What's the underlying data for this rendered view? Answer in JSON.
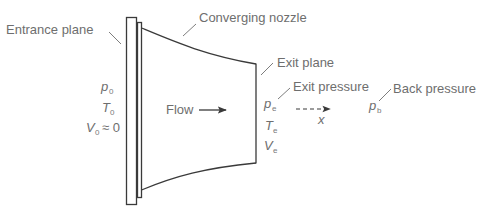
{
  "figure": {
    "labels": {
      "entrance_plane": "Entrance plane",
      "converging_nozzle": "Converging nozzle",
      "exit_plane": "Exit plane",
      "exit_pressure": "Exit pressure",
      "back_pressure": "Back pressure",
      "flow": "Flow",
      "x_axis": "x"
    },
    "inlet_conditions": {
      "pressure": {
        "symbol": "p",
        "subscript": "0"
      },
      "temperature": {
        "symbol": "T",
        "subscript": "0"
      },
      "velocity": {
        "symbol": "V",
        "subscript": "0",
        "relation": "≈ 0"
      }
    },
    "exit_conditions": {
      "pressure": {
        "symbol": "p",
        "subscript": "e"
      },
      "temperature": {
        "symbol": "T",
        "subscript": "e"
      },
      "velocity": {
        "symbol": "V",
        "subscript": "e"
      }
    },
    "back_condition": {
      "pressure": {
        "symbol": "p",
        "subscript": "b"
      }
    },
    "colors": {
      "outline": "#3a3a3a",
      "text": "#6e6e6e",
      "background": "#ffffff"
    }
  }
}
